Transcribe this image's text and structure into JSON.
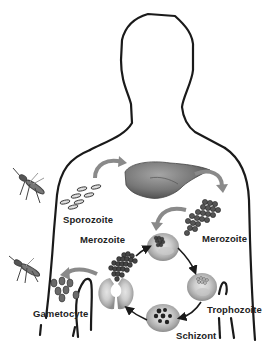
{
  "labels": {
    "sporozoite": "Sporozoite",
    "merozoite_liver": "Merozoite",
    "merozoite_blood": "Merozoite",
    "trophozoite": "Trophozoite",
    "schizont": "Schizont",
    "gametocyte": "Gametocyte"
  },
  "icons": [
    "mosquito-icon",
    "liver-icon",
    "red-blood-cell-icon",
    "merozoite-cluster-icon",
    "sporozoite-icon",
    "gametocyte-icon"
  ],
  "colors": {
    "outline": "#1a1a1a",
    "rbc_fill": "#b8b8b8",
    "liver_fill": "#7a7a7a",
    "arrow_fill": "#8a8a8a",
    "label_text": "#222222"
  }
}
